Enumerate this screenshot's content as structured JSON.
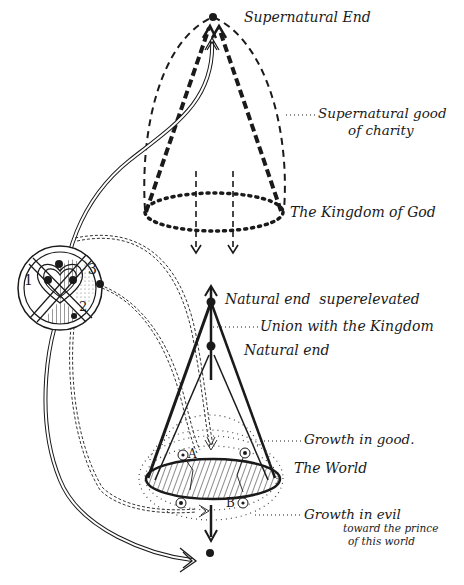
{
  "diagram": {
    "type": "theological schematic",
    "upper_cone": {
      "apex_label": "Supernatural End",
      "side_label": "Supernatural good",
      "side_label_line2": "of charity",
      "base_label": "The Kingdom of God"
    },
    "lower_cone": {
      "top_label": "Natural end  superelevated",
      "union_label": "Union with the Kingdom",
      "mid_label": "Natural end",
      "good_label": "Growth in good.",
      "base_label": "The World",
      "evil_label": "Growth in evil",
      "evil_label_line2": "toward the prince",
      "evil_label_line3": "of this world",
      "point_a": "A",
      "point_b": "B"
    },
    "heart_emblem": {
      "zone_1": "1",
      "zone_2": "2",
      "zone_3": "3"
    },
    "colors": {
      "ink": "#1a1a1a",
      "background": "#ffffff"
    }
  }
}
